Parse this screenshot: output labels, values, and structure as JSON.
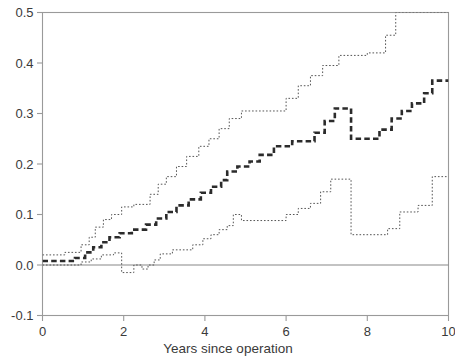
{
  "chart_data": {
    "type": "line",
    "title": "",
    "subtitle": "",
    "xlabel": "Years since operation",
    "ylabel": "",
    "xlim": [
      0,
      10
    ],
    "ylim": [
      -0.1,
      0.5
    ],
    "xticks": [
      0,
      2,
      4,
      6,
      8,
      10
    ],
    "xticklabels": [
      "0",
      "2",
      "4",
      "6",
      "8",
      "10"
    ],
    "yticks": [
      -0.1,
      0.0,
      0.1,
      0.2,
      0.3,
      0.4,
      0.5
    ],
    "yticklabels": [
      "-0.1",
      "0.0",
      "0.1",
      "0.2",
      "0.3",
      "0.4",
      "0.5"
    ],
    "grid": false,
    "legend": null,
    "frame": "box",
    "step_interpolation": "post",
    "reference_lines": [
      {
        "name": "zero-line",
        "orientation": "horizontal",
        "y": 0.0,
        "style": "solid",
        "color": "#888888"
      }
    ],
    "series": [
      {
        "name": "upper-confidence-band",
        "style": "dotted",
        "color": "#555555",
        "width": 1,
        "clipped_at_top": true,
        "points": [
          [
            0.0,
            0.02
          ],
          [
            0.55,
            0.02
          ],
          [
            0.55,
            0.025
          ],
          [
            0.95,
            0.025
          ],
          [
            0.95,
            0.04
          ],
          [
            1.15,
            0.04
          ],
          [
            1.15,
            0.055
          ],
          [
            1.3,
            0.055
          ],
          [
            1.3,
            0.075
          ],
          [
            1.5,
            0.075
          ],
          [
            1.5,
            0.09
          ],
          [
            1.7,
            0.09
          ],
          [
            1.7,
            0.1
          ],
          [
            1.95,
            0.1
          ],
          [
            1.95,
            0.115
          ],
          [
            2.25,
            0.115
          ],
          [
            2.25,
            0.12
          ],
          [
            2.65,
            0.12
          ],
          [
            2.65,
            0.14
          ],
          [
            2.85,
            0.14
          ],
          [
            2.85,
            0.16
          ],
          [
            3.05,
            0.16
          ],
          [
            3.05,
            0.175
          ],
          [
            3.3,
            0.175
          ],
          [
            3.3,
            0.195
          ],
          [
            3.55,
            0.195
          ],
          [
            3.55,
            0.215
          ],
          [
            3.85,
            0.215
          ],
          [
            3.85,
            0.235
          ],
          [
            4.1,
            0.235
          ],
          [
            4.1,
            0.25
          ],
          [
            4.35,
            0.25
          ],
          [
            4.35,
            0.27
          ],
          [
            4.6,
            0.27
          ],
          [
            4.6,
            0.29
          ],
          [
            4.9,
            0.29
          ],
          [
            4.9,
            0.305
          ],
          [
            6.0,
            0.305
          ],
          [
            6.0,
            0.33
          ],
          [
            6.3,
            0.33
          ],
          [
            6.3,
            0.355
          ],
          [
            6.6,
            0.355
          ],
          [
            6.6,
            0.375
          ],
          [
            6.9,
            0.375
          ],
          [
            6.9,
            0.395
          ],
          [
            7.3,
            0.395
          ],
          [
            7.3,
            0.415
          ],
          [
            8.0,
            0.415
          ],
          [
            8.0,
            0.42
          ],
          [
            8.45,
            0.42
          ],
          [
            8.45,
            0.455
          ],
          [
            8.7,
            0.455
          ],
          [
            8.7,
            0.5
          ],
          [
            10.0,
            0.5
          ]
        ]
      },
      {
        "name": "estimate-curve",
        "style": "dashed-bold",
        "color": "#2b2b2b",
        "width": 2.6,
        "points": [
          [
            0.0,
            0.008
          ],
          [
            0.8,
            0.008
          ],
          [
            0.8,
            0.014
          ],
          [
            1.05,
            0.014
          ],
          [
            1.05,
            0.025
          ],
          [
            1.25,
            0.025
          ],
          [
            1.25,
            0.035
          ],
          [
            1.45,
            0.035
          ],
          [
            1.45,
            0.045
          ],
          [
            1.65,
            0.045
          ],
          [
            1.65,
            0.055
          ],
          [
            1.9,
            0.055
          ],
          [
            1.9,
            0.063
          ],
          [
            2.2,
            0.063
          ],
          [
            2.2,
            0.07
          ],
          [
            2.55,
            0.07
          ],
          [
            2.55,
            0.08
          ],
          [
            2.8,
            0.08
          ],
          [
            2.8,
            0.092
          ],
          [
            3.05,
            0.092
          ],
          [
            3.05,
            0.105
          ],
          [
            3.3,
            0.105
          ],
          [
            3.3,
            0.118
          ],
          [
            3.6,
            0.118
          ],
          [
            3.6,
            0.13
          ],
          [
            3.9,
            0.13
          ],
          [
            3.9,
            0.143
          ],
          [
            4.15,
            0.143
          ],
          [
            4.15,
            0.155
          ],
          [
            4.4,
            0.155
          ],
          [
            4.4,
            0.168
          ],
          [
            4.55,
            0.168
          ],
          [
            4.55,
            0.185
          ],
          [
            4.8,
            0.185
          ],
          [
            4.8,
            0.195
          ],
          [
            5.1,
            0.195
          ],
          [
            5.1,
            0.205
          ],
          [
            5.35,
            0.205
          ],
          [
            5.35,
            0.218
          ],
          [
            5.7,
            0.218
          ],
          [
            5.7,
            0.235
          ],
          [
            6.15,
            0.235
          ],
          [
            6.15,
            0.245
          ],
          [
            6.7,
            0.245
          ],
          [
            6.7,
            0.262
          ],
          [
            6.95,
            0.262
          ],
          [
            6.95,
            0.285
          ],
          [
            7.2,
            0.285
          ],
          [
            7.2,
            0.31
          ],
          [
            7.6,
            0.31
          ],
          [
            7.6,
            0.25
          ],
          [
            8.3,
            0.25
          ],
          [
            8.3,
            0.268
          ],
          [
            8.6,
            0.268
          ],
          [
            8.6,
            0.29
          ],
          [
            8.85,
            0.29
          ],
          [
            8.85,
            0.305
          ],
          [
            9.1,
            0.305
          ],
          [
            9.1,
            0.32
          ],
          [
            9.4,
            0.32
          ],
          [
            9.4,
            0.34
          ],
          [
            9.6,
            0.34
          ],
          [
            9.6,
            0.365
          ],
          [
            10.0,
            0.365
          ]
        ]
      },
      {
        "name": "lower-confidence-band",
        "style": "dotted",
        "color": "#555555",
        "width": 1,
        "points": [
          [
            0.0,
            0.0
          ],
          [
            0.95,
            0.0
          ],
          [
            0.95,
            0.006
          ],
          [
            1.2,
            0.006
          ],
          [
            1.2,
            0.012
          ],
          [
            1.45,
            0.012
          ],
          [
            1.45,
            0.02
          ],
          [
            1.75,
            0.02
          ],
          [
            1.75,
            0.024
          ],
          [
            1.95,
            0.024
          ],
          [
            1.95,
            -0.015
          ],
          [
            2.25,
            -0.015
          ],
          [
            2.25,
            0.0
          ],
          [
            2.45,
            0.0
          ],
          [
            2.45,
            -0.008
          ],
          [
            2.6,
            -0.008
          ],
          [
            2.6,
            0.0
          ],
          [
            2.75,
            0.0
          ],
          [
            2.75,
            0.01
          ],
          [
            2.9,
            0.01
          ],
          [
            2.9,
            0.022
          ],
          [
            3.2,
            0.022
          ],
          [
            3.2,
            0.03
          ],
          [
            3.7,
            0.03
          ],
          [
            3.7,
            0.04
          ],
          [
            3.95,
            0.04
          ],
          [
            3.95,
            0.052
          ],
          [
            4.15,
            0.052
          ],
          [
            4.15,
            0.06
          ],
          [
            4.35,
            0.06
          ],
          [
            4.35,
            0.07
          ],
          [
            4.55,
            0.07
          ],
          [
            4.55,
            0.078
          ],
          [
            4.7,
            0.078
          ],
          [
            4.7,
            0.1
          ],
          [
            4.9,
            0.1
          ],
          [
            4.9,
            0.088
          ],
          [
            6.0,
            0.088
          ],
          [
            6.0,
            0.1
          ],
          [
            6.3,
            0.1
          ],
          [
            6.3,
            0.112
          ],
          [
            6.6,
            0.112
          ],
          [
            6.6,
            0.122
          ],
          [
            6.85,
            0.122
          ],
          [
            6.85,
            0.145
          ],
          [
            7.1,
            0.145
          ],
          [
            7.1,
            0.17
          ],
          [
            7.6,
            0.17
          ],
          [
            7.6,
            0.06
          ],
          [
            8.5,
            0.06
          ],
          [
            8.5,
            0.072
          ],
          [
            8.8,
            0.072
          ],
          [
            8.8,
            0.105
          ],
          [
            9.25,
            0.105
          ],
          [
            9.25,
            0.118
          ],
          [
            9.6,
            0.118
          ],
          [
            9.6,
            0.175
          ],
          [
            10.0,
            0.175
          ]
        ]
      }
    ]
  }
}
